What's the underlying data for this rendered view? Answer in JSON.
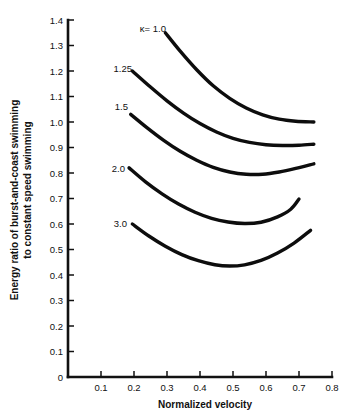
{
  "chart_data": {
    "type": "line",
    "title": "",
    "xlabel": "Normalized velocity",
    "ylabel_line1": "Energy ratio of burst-and-coast swimming",
    "ylabel_line2": "to constant speed swimming",
    "xlim": [
      0,
      0.8
    ],
    "ylim": [
      0,
      1.4
    ],
    "grid": false,
    "legend_position": "inline-curve-labels",
    "xticks": [
      "0.1",
      "0.2",
      "0.3",
      "0.4",
      "0.5",
      "0.6",
      "0.7",
      "0.8"
    ],
    "xtick_values": [
      0.1,
      0.2,
      0.3,
      0.4,
      0.5,
      0.6,
      0.7,
      0.8
    ],
    "yticks": [
      "0",
      "0.1",
      "0.2",
      "0.3",
      "0.4",
      "0.5",
      "0.6",
      "0.7",
      "0.8",
      "0.9",
      "1.0",
      "1.1",
      "1.2",
      "1.3",
      "1.4"
    ],
    "ytick_values": [
      0,
      0.1,
      0.2,
      0.3,
      0.4,
      0.5,
      0.6,
      0.7,
      0.8,
      0.9,
      1.0,
      1.1,
      1.2,
      1.3,
      1.4
    ],
    "series_symbol": "κ",
    "series": [
      {
        "name": "κ = 1.0",
        "label": "κ= 1.0",
        "x": [
          0.295,
          0.34,
          0.39,
          0.44,
          0.49,
          0.54,
          0.59,
          0.64,
          0.69,
          0.745
        ],
        "values": [
          1.35,
          1.278,
          1.205,
          1.142,
          1.093,
          1.055,
          1.028,
          1.011,
          1.003,
          1.0
        ]
      },
      {
        "name": "κ = 1.25",
        "label": "1.25",
        "x": [
          0.195,
          0.25,
          0.3,
          0.35,
          0.4,
          0.45,
          0.5,
          0.55,
          0.6,
          0.65,
          0.7,
          0.745
        ],
        "values": [
          1.2,
          1.137,
          1.083,
          1.035,
          0.994,
          0.961,
          0.936,
          0.92,
          0.911,
          0.908,
          0.909,
          0.913
        ]
      },
      {
        "name": "κ = 1.5",
        "label": "1.5",
        "x": [
          0.19,
          0.24,
          0.29,
          0.34,
          0.39,
          0.44,
          0.49,
          0.54,
          0.59,
          0.64,
          0.69,
          0.745
        ],
        "values": [
          1.03,
          0.977,
          0.928,
          0.885,
          0.85,
          0.822,
          0.804,
          0.795,
          0.795,
          0.804,
          0.818,
          0.836
        ]
      },
      {
        "name": "κ = 2.0",
        "label": "2.0",
        "x": [
          0.185,
          0.235,
          0.285,
          0.335,
          0.385,
          0.435,
          0.485,
          0.535,
          0.585,
          0.635,
          0.675,
          0.7
        ],
        "values": [
          0.82,
          0.765,
          0.718,
          0.678,
          0.646,
          0.622,
          0.608,
          0.602,
          0.607,
          0.628,
          0.658,
          0.698
        ]
      },
      {
        "name": "κ = 3.0",
        "label": "3.0",
        "x": [
          0.195,
          0.245,
          0.295,
          0.345,
          0.395,
          0.445,
          0.49,
          0.535,
          0.585,
          0.635,
          0.685,
          0.735
        ],
        "values": [
          0.6,
          0.553,
          0.513,
          0.48,
          0.456,
          0.44,
          0.435,
          0.44,
          0.457,
          0.486,
          0.525,
          0.575
        ]
      }
    ]
  },
  "style": {
    "axis_color": "#111111",
    "curve_color": "#0d0d0d",
    "background": "#ffffff"
  }
}
